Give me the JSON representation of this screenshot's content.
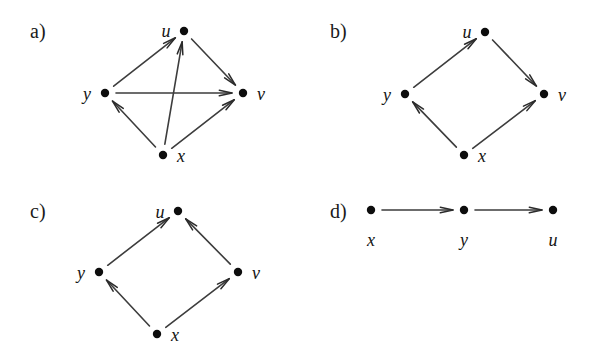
{
  "figure": {
    "width": 598,
    "height": 359,
    "background": "#ffffff",
    "ink_color": "#1a1a1a",
    "edge_color": "#3d3d3d",
    "node_color": "#0d0d0d"
  },
  "panels": [
    {
      "id": "a",
      "label": "a)",
      "label_pos": {
        "x": 30,
        "y": 38
      },
      "nodes": [
        {
          "name": "u",
          "label": "u",
          "x": 184,
          "y": 31,
          "label_x": 166,
          "label_y": 37
        },
        {
          "name": "y",
          "label": "y",
          "x": 105,
          "y": 93,
          "label_x": 87,
          "label_y": 100
        },
        {
          "name": "v",
          "label": "v",
          "x": 243,
          "y": 93,
          "label_x": 261,
          "label_y": 100
        },
        {
          "name": "x",
          "label": "x",
          "x": 163,
          "y": 155,
          "label_x": 181,
          "label_y": 162
        }
      ],
      "edges": [
        {
          "from": "y",
          "to": "u",
          "label": "y-to-u"
        },
        {
          "from": "u",
          "to": "v",
          "label": "u-to-v"
        },
        {
          "from": "y",
          "to": "v",
          "label": "y-to-v"
        },
        {
          "from": "x",
          "to": "y",
          "label": "x-to-y"
        },
        {
          "from": "x",
          "to": "v",
          "label": "x-to-v"
        },
        {
          "from": "x",
          "to": "u",
          "label": "x-to-u"
        }
      ]
    },
    {
      "id": "b",
      "label": "b)",
      "label_pos": {
        "x": 330,
        "y": 38
      },
      "nodes": [
        {
          "name": "u",
          "label": "u",
          "x": 485,
          "y": 32,
          "label_x": 467,
          "label_y": 38
        },
        {
          "name": "y",
          "label": "y",
          "x": 405,
          "y": 94,
          "label_x": 387,
          "label_y": 101
        },
        {
          "name": "v",
          "label": "v",
          "x": 544,
          "y": 94,
          "label_x": 562,
          "label_y": 101
        },
        {
          "name": "x",
          "label": "x",
          "x": 464,
          "y": 155,
          "label_x": 482,
          "label_y": 162
        }
      ],
      "edges": [
        {
          "from": "y",
          "to": "u",
          "label": "y-to-u"
        },
        {
          "from": "u",
          "to": "v",
          "label": "u-to-v"
        },
        {
          "from": "x",
          "to": "y",
          "label": "x-to-y"
        },
        {
          "from": "x",
          "to": "v",
          "label": "x-to-v"
        }
      ]
    },
    {
      "id": "c",
      "label": "c)",
      "label_pos": {
        "x": 30,
        "y": 218
      },
      "nodes": [
        {
          "name": "u",
          "label": "u",
          "x": 178,
          "y": 211,
          "label_x": 160,
          "label_y": 218
        },
        {
          "name": "y",
          "label": "y",
          "x": 99,
          "y": 272,
          "label_x": 81,
          "label_y": 279
        },
        {
          "name": "v",
          "label": "v",
          "x": 238,
          "y": 272,
          "label_x": 256,
          "label_y": 279
        },
        {
          "name": "x",
          "label": "x",
          "x": 157,
          "y": 334,
          "label_x": 175,
          "label_y": 341
        }
      ],
      "edges": [
        {
          "from": "y",
          "to": "u",
          "label": "y-to-u"
        },
        {
          "from": "v",
          "to": "u",
          "label": "v-to-u"
        },
        {
          "from": "x",
          "to": "y",
          "label": "x-to-y"
        },
        {
          "from": "x",
          "to": "v",
          "label": "x-to-v"
        }
      ]
    },
    {
      "id": "d",
      "label": "d)",
      "label_pos": {
        "x": 330,
        "y": 218
      },
      "nodes": [
        {
          "name": "x",
          "label": "x",
          "x": 371,
          "y": 210,
          "label_x": 371,
          "label_y": 246
        },
        {
          "name": "y",
          "label": "y",
          "x": 464,
          "y": 210,
          "label_x": 464,
          "label_y": 246
        },
        {
          "name": "u",
          "label": "u",
          "x": 553,
          "y": 210,
          "label_x": 553,
          "label_y": 246
        }
      ],
      "edges": [
        {
          "from": "x",
          "to": "y",
          "label": "x-to-y"
        },
        {
          "from": "y",
          "to": "u",
          "label": "y-to-u"
        }
      ]
    }
  ]
}
